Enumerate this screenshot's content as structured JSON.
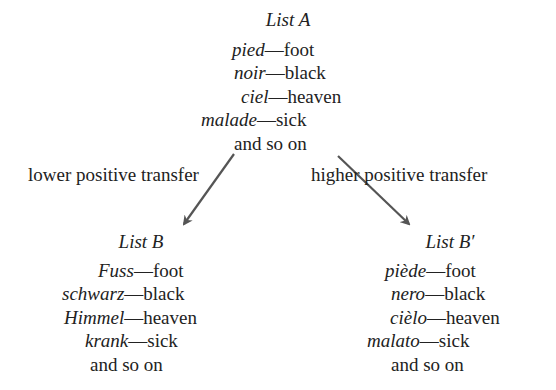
{
  "list_a": {
    "title": "List A",
    "items": [
      {
        "foreign": "pied",
        "english": "foot"
      },
      {
        "foreign": "noir",
        "english": "black"
      },
      {
        "foreign": "ciel",
        "english": "heaven"
      },
      {
        "foreign": "malade",
        "english": "sick"
      }
    ],
    "footer": "and so on"
  },
  "list_b": {
    "title": "List B",
    "items": [
      {
        "foreign": "Fuss",
        "english": "foot"
      },
      {
        "foreign": "schwarz",
        "english": "black"
      },
      {
        "foreign": "Himmel",
        "english": "heaven"
      },
      {
        "foreign": "krank",
        "english": "sick"
      }
    ],
    "footer": "and so on"
  },
  "list_b_prime": {
    "title": "List B′",
    "items": [
      {
        "foreign": "piède",
        "english": "foot"
      },
      {
        "foreign": "nero",
        "english": "black"
      },
      {
        "foreign": "cièlo",
        "english": "heaven"
      },
      {
        "foreign": "malato",
        "english": "sick"
      }
    ],
    "footer": "and so on"
  },
  "labels": {
    "left_arrow": "lower positive transfer",
    "right_arrow": "higher positive transfer"
  },
  "dash": "—",
  "colors": {
    "arrow": "#555555",
    "text": "#222222"
  }
}
